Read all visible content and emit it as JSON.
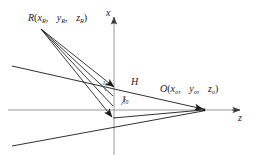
{
  "figure": {
    "type": "geometry-diagram",
    "background_color": "#ffffff",
    "line_color": "#1a1a1a",
    "axis_color": "#8c8c8c"
  },
  "axes": {
    "x_label": "x",
    "z_label": "z",
    "x_axis": {
      "x": 114,
      "y_top": 18,
      "y_bottom": 155
    },
    "z_axis": {
      "y": 110,
      "x_left": 8,
      "x_right": 246
    }
  },
  "points": {
    "R": {
      "name": "R",
      "label_name": "R",
      "coords": [
        "x",
        "y",
        "z"
      ],
      "subscript": "R",
      "label_text": "R(xR, yR, zR)",
      "px": 40,
      "py": 28
    },
    "O": {
      "name": "O",
      "label_name": "O",
      "coords": [
        "x",
        "y",
        "z"
      ],
      "subscript": "o",
      "label_text": "O(xo, yo, zo)",
      "px": 205,
      "py": 110
    },
    "H": {
      "name": "H",
      "label_text": "H",
      "px": 114,
      "py": 88
    }
  },
  "labels": {
    "l_zero": {
      "base": "l",
      "sub": "0",
      "text": "l0"
    },
    "l_R": {
      "base": "l",
      "sub": "R",
      "text": "lR"
    }
  },
  "geometry": {
    "rays_from_R": [
      {
        "x1": 41,
        "y1": 29,
        "x2": 116,
        "y2": 88
      },
      {
        "x1": 41,
        "y1": 29,
        "x2": 115,
        "y2": 96
      },
      {
        "x1": 41,
        "y1": 29,
        "x2": 114,
        "y2": 108
      },
      {
        "x1": 41,
        "y1": 29,
        "x2": 113,
        "y2": 118
      }
    ],
    "wedge_lines": [
      {
        "x1": 12,
        "y1": 66,
        "x2": 205,
        "y2": 110
      },
      {
        "x1": 12,
        "y1": 146,
        "x2": 205,
        "y2": 110
      }
    ],
    "converge_point": {
      "x": 205,
      "y": 110
    }
  }
}
